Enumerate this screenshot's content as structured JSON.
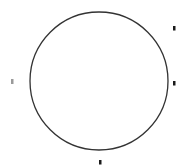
{
  "diagram": {
    "width": 186,
    "height": 167,
    "background": "#ffffff",
    "circle": {
      "cx": 99,
      "cy": 81,
      "r": 69,
      "stroke": "#333333",
      "stroke_width": 1.3
    },
    "markers": [
      {
        "id": "top-right",
        "x": 173,
        "y": 26,
        "w": 2.5,
        "h": 4.5,
        "color": "#1a1a1a"
      },
      {
        "id": "left",
        "x": 11,
        "y": 79,
        "w": 2.5,
        "h": 5,
        "color": "#9a9a9a"
      },
      {
        "id": "right",
        "x": 173,
        "y": 81,
        "w": 2.5,
        "h": 4.5,
        "color": "#1a1a1a"
      },
      {
        "id": "bottom",
        "x": 99,
        "y": 160,
        "w": 2.5,
        "h": 4.5,
        "color": "#1a1a1a"
      }
    ]
  }
}
